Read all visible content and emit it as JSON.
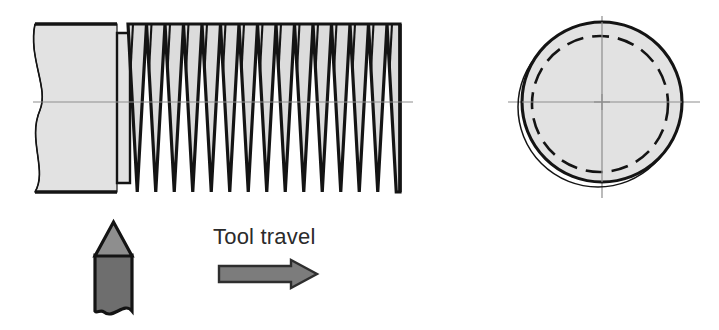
{
  "figure": {
    "annotations": {
      "tool_travel_label": "Tool travel"
    },
    "icons": {
      "tool_travel_arrow": "right-arrow-icon",
      "cutting-tool": "cutting-tool-icon"
    }
  },
  "workpiece_side_view": {
    "name": "threaded-bolt-side-view",
    "shank": {
      "label": "unthreaded shank",
      "x_start": 33,
      "x_end": 117,
      "y_top": 24,
      "y_bottom": 192,
      "break_line": "S-curve conventional break at left end"
    },
    "shoulder": {
      "label": "shoulder step",
      "x_start": 117,
      "x_end": 128,
      "y_top": 33,
      "y_bottom": 183
    },
    "threads": {
      "label": "V-form external thread",
      "x_start": 128,
      "x_end": 400,
      "peak_y": 24,
      "valley_y": 192,
      "tooth_count": 15,
      "pitch_px": 18.5,
      "flank_angle_deg": 60
    },
    "center_axis": {
      "label": "axis of rotation",
      "y": 102,
      "x_start": 33,
      "x_end": 413,
      "style": "thin center line"
    }
  },
  "workpiece_end_view": {
    "name": "threaded-bolt-end-view",
    "center_x": 602,
    "center_y": 102,
    "major_diameter_circle": {
      "label": "major diameter (crest)",
      "radius": 80,
      "style": "solid"
    },
    "minor_diameter_circle": {
      "label": "minor diameter (root)",
      "radius": 68,
      "style": "dashed"
    },
    "offset_arc": {
      "label": "thread helix offset arc",
      "radius": 80,
      "offset_x": -4,
      "offset_y": 5,
      "style": "thin solid"
    },
    "crosshair": {
      "label": "center lines",
      "extent": 96,
      "style": "thin center line"
    }
  },
  "cutting_tool": {
    "name": "single-point-threading-tool",
    "label": "single point cutting tool",
    "tip": {
      "label": "60 degree V tool tip",
      "x_left": 92,
      "x_right": 135,
      "y_apex": 222,
      "y_base": 256
    },
    "body": {
      "label": "tool shank",
      "y_top": 256,
      "y_bottom": 316,
      "break_line": "wavy conventional break at bottom"
    }
  },
  "tool_travel_arrow": {
    "name": "tool-travel-arrow",
    "label": "direction of tool travel",
    "direction": "right",
    "x_start": 218,
    "x_end": 318,
    "y_center": 274,
    "shaft_half_height": 8,
    "head_half_height": 14
  },
  "colors": {
    "outline": "#141414",
    "metal_fill": "#e2e2e2",
    "thread_flank_fill": "#dcdcdc",
    "tool_tip_fill": "#8e8e8e",
    "tool_body_fill": "#6e6e6e",
    "center_line": "#8d8d8d",
    "arrow_fill": "#7c7c7c",
    "arrow_outline": "#2e2e2e",
    "text": "#2b2b2b",
    "background": "#ffffff"
  }
}
